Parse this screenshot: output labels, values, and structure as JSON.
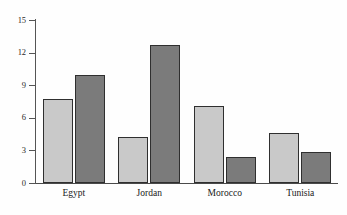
{
  "chart_data": {
    "type": "bar",
    "title": "",
    "subtitle": "",
    "xlabel": "",
    "ylabel": "",
    "categories": [
      "Egypt",
      "Jordan",
      "Morocco",
      "Tunisia"
    ],
    "series": [
      {
        "name": "light-series",
        "color": "#c9c9c9",
        "values": [
          7.7,
          4.2,
          7.1,
          4.6
        ]
      },
      {
        "name": "dark-series",
        "color": "#7b7b7b",
        "values": [
          9.9,
          12.7,
          2.4,
          2.85
        ]
      }
    ],
    "ylim": [
      0,
      15
    ],
    "yticks": [
      0,
      3,
      6,
      9,
      12,
      15
    ],
    "ytick_labels": [
      "0",
      "3",
      "6",
      "9",
      "12",
      "15"
    ],
    "xticks": [],
    "grid": false,
    "legend": "none",
    "annotations": []
  },
  "axes": {
    "y_axis_name": "y-axis",
    "x_axis_name": "x-axis"
  },
  "colors": {
    "light_bar": "#c9c9c9",
    "dark_bar": "#7b7b7b",
    "bar_outline": "#2f2f2f",
    "axis": "#555555",
    "text": "#1a1a1a",
    "background": "#fefefe"
  }
}
